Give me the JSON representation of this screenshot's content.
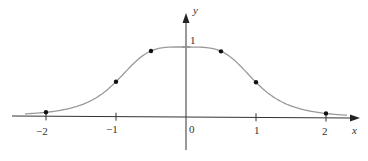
{
  "chart_data": {
    "type": "line",
    "title": "",
    "function_hint": "y = 1/(1+x^4)",
    "xlabel": "x",
    "ylabel": "y",
    "xlim": [
      -2.4,
      2.5
    ],
    "ylim": [
      -0.4,
      1.35
    ],
    "x_ticks": [
      "-2",
      "-1",
      "0",
      "1",
      "2"
    ],
    "y_ticks": [
      "1"
    ],
    "origin_label": "0",
    "grid": false,
    "legend": null,
    "curve": {
      "x": [
        -2.3,
        -2,
        -1.5,
        -1.25,
        -1,
        -0.75,
        -0.5,
        -0.25,
        0,
        0.25,
        0.5,
        0.75,
        1,
        1.25,
        1.5,
        2,
        2.3
      ],
      "y": [
        0.036,
        0.059,
        0.165,
        0.291,
        0.5,
        0.76,
        0.941,
        0.996,
        1.0,
        0.996,
        0.941,
        0.76,
        0.5,
        0.291,
        0.165,
        0.059,
        0.036
      ]
    },
    "points": {
      "x": [
        -2,
        -1,
        -0.5,
        0.5,
        1,
        2
      ],
      "y": [
        0.06,
        0.5,
        0.94,
        0.94,
        0.5,
        0.06
      ]
    },
    "colors": {
      "curve": "#9a9a9a",
      "axes": "#333333",
      "points": "#111111"
    }
  }
}
